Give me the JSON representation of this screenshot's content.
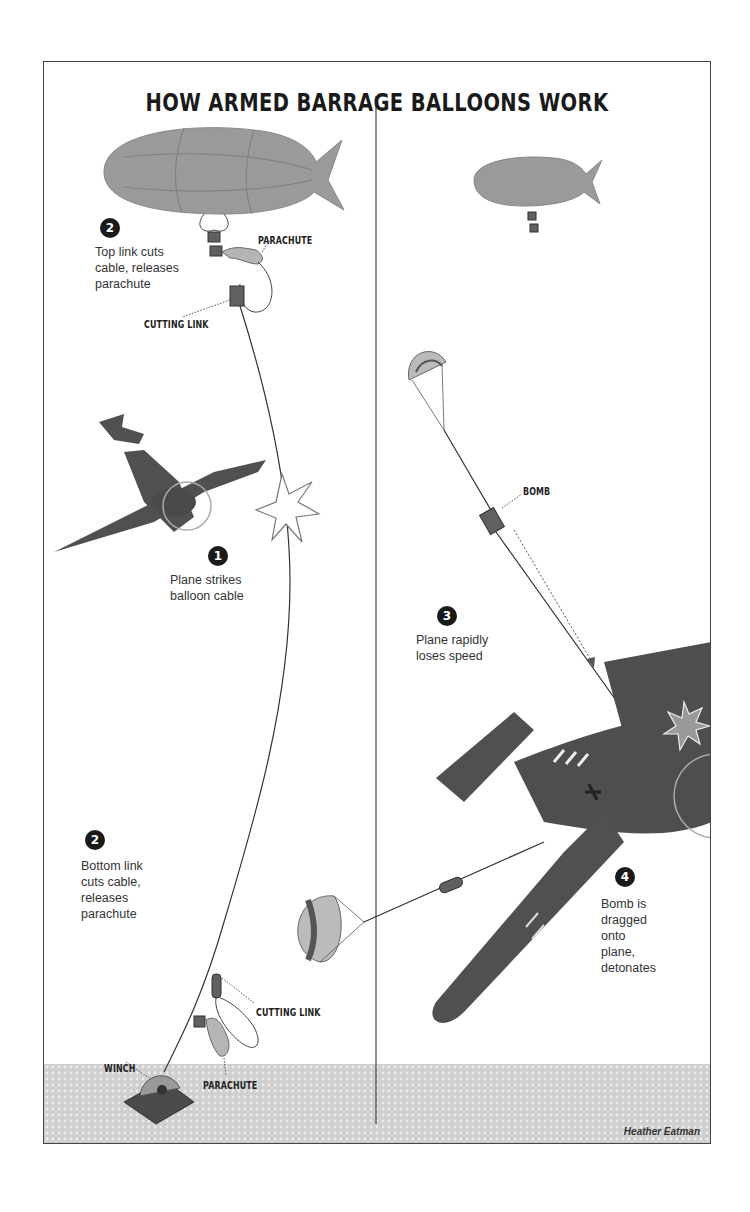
{
  "title": "HOW ARMED BARRAGE BALLOONS WORK",
  "colors": {
    "balloon": "#9a9a9a",
    "plane": "#505050",
    "ground": "#d4d4d4",
    "step_badge": "#1a1a1a",
    "frame": "#444444"
  },
  "left_panel": {
    "steps": [
      {
        "number": "2",
        "caption": "Top link cuts\ncable, releases\nparachute"
      },
      {
        "number": "1",
        "caption": "Plane strikes\nballoon cable"
      },
      {
        "number": "2",
        "caption": "Bottom link\ncuts cable,\nreleases\nparachute"
      }
    ],
    "labels": {
      "parachute_top": "PARACHUTE",
      "cutting_link_top": "CUTTING LINK",
      "cutting_link_bottom": "CUTTING LINK",
      "parachute_bottom": "PARACHUTE",
      "winch": "WINCH"
    }
  },
  "right_panel": {
    "steps": [
      {
        "number": "3",
        "caption": "Plane rapidly\nloses speed"
      },
      {
        "number": "4",
        "caption": "Bomb is\ndragged\nonto\nplane,\ndetonates"
      }
    ],
    "labels": {
      "bomb": "BOMB"
    }
  },
  "credit": "Heather Eatman"
}
